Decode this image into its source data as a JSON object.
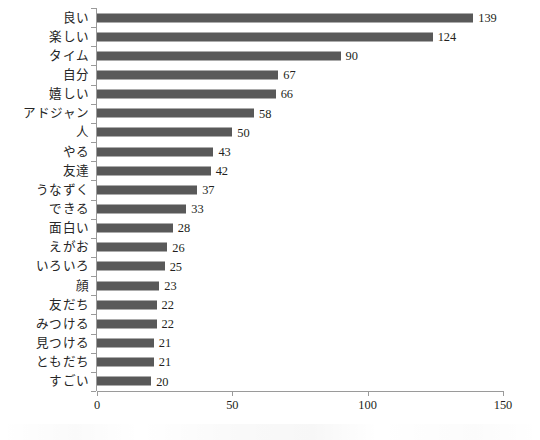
{
  "chart_data": {
    "type": "bar",
    "orientation": "horizontal",
    "title": "",
    "subtitle": "",
    "xlabel": "",
    "ylabel": "",
    "xlim": [
      0,
      150
    ],
    "xticks": [
      "0",
      "50",
      "100",
      "150"
    ],
    "grid": false,
    "legend": null,
    "bar_color": "#595959",
    "axis_color": "#9a9a9a",
    "categories": [
      "良い",
      "楽しい",
      "タイム",
      "自分",
      "嬉しい",
      "アドジャン",
      "人",
      "やる",
      "友達",
      "うなずく",
      "できる",
      "面白い",
      "えがお",
      "いろいろ",
      "顔",
      "友だち",
      "みつける",
      "見つける",
      "ともだち",
      "すごい"
    ],
    "values": [
      139,
      124,
      90,
      67,
      66,
      58,
      50,
      43,
      42,
      37,
      33,
      28,
      26,
      25,
      23,
      22,
      22,
      21,
      21,
      20
    ],
    "value_labels": [
      "139",
      "124",
      "90",
      "67",
      "66",
      "58",
      "50",
      "43",
      "42",
      "37",
      "33",
      "28",
      "26",
      "25",
      "23",
      "22",
      "22",
      "21",
      "21",
      "20"
    ]
  }
}
